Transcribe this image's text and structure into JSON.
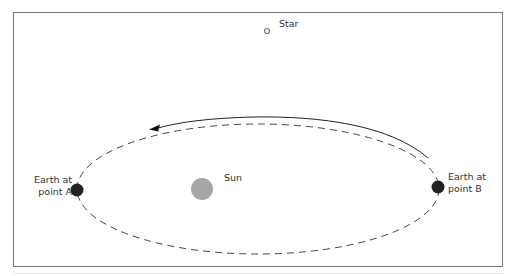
{
  "diagram": {
    "labels": {
      "star": "Star",
      "sun": "Sun",
      "earth_a_line1": "Earth at",
      "earth_a_line2": "point A",
      "earth_b_line1": "Earth at",
      "earth_b_line2": "point B"
    },
    "colors": {
      "frame": "#7a7a7a",
      "orbit": "#444444",
      "earth": "#222222",
      "sun": "#a6a6a6",
      "star": "#888888",
      "text": "#333333"
    },
    "elements": [
      {
        "name": "star",
        "shape": "small-circle",
        "cx": 267,
        "cy": 31
      },
      {
        "name": "sun",
        "shape": "circle",
        "cx": 202,
        "cy": 189
      },
      {
        "name": "earth-a",
        "shape": "circle",
        "cx": 77,
        "cy": 190
      },
      {
        "name": "earth-b",
        "shape": "circle",
        "cx": 438,
        "cy": 187
      },
      {
        "name": "orbit",
        "shape": "dashed-ellipse"
      },
      {
        "name": "direction-arrow",
        "shape": "curved-arrow",
        "direction": "counter-clockwise (B to A over the top)"
      }
    ]
  }
}
